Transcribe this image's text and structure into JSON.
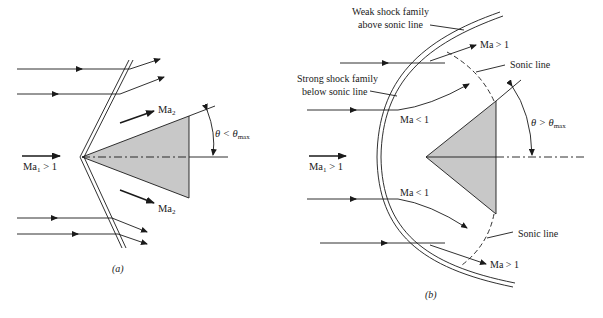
{
  "figure": {
    "panel_a": {
      "caption": "(a)",
      "labels": {
        "upstream_mach": "Ma",
        "upstream_sub": "1",
        "upstream_cond": " > 1",
        "downstream_mach_top": "Ma",
        "downstream_sub_top": "2",
        "downstream_mach_bottom": "Ma",
        "downstream_sub_bottom": "2",
        "angle_theta": "θ < θ",
        "angle_sub": "max"
      },
      "shock_type": "attached oblique shock",
      "wedge_fill": "#c8c8c8"
    },
    "panel_b": {
      "caption": "(b)",
      "labels": {
        "weak_family_line1": "Weak shock family",
        "weak_family_line2": "above sonic line",
        "strong_family_line1": "Strong shock family",
        "strong_family_line2": "below sonic line",
        "ma_gt1_top": "Ma > 1",
        "ma_gt1_bottom": "Ma > 1",
        "ma_lt1_top": "Ma < 1",
        "ma_lt1_bottom": "Ma < 1",
        "sonic_line_top": "Sonic line",
        "sonic_line_bottom": "Sonic line",
        "upstream_mach": "Ma",
        "upstream_sub": "1",
        "upstream_cond": " > 1",
        "angle_theta": "θ > θ",
        "angle_sub": "max"
      },
      "shock_type": "detached bow shock",
      "wedge_fill": "#c8c8c8"
    },
    "colors": {
      "line": "#1a1a1a",
      "wedge": "#c8c8c8",
      "background": "#ffffff"
    }
  }
}
